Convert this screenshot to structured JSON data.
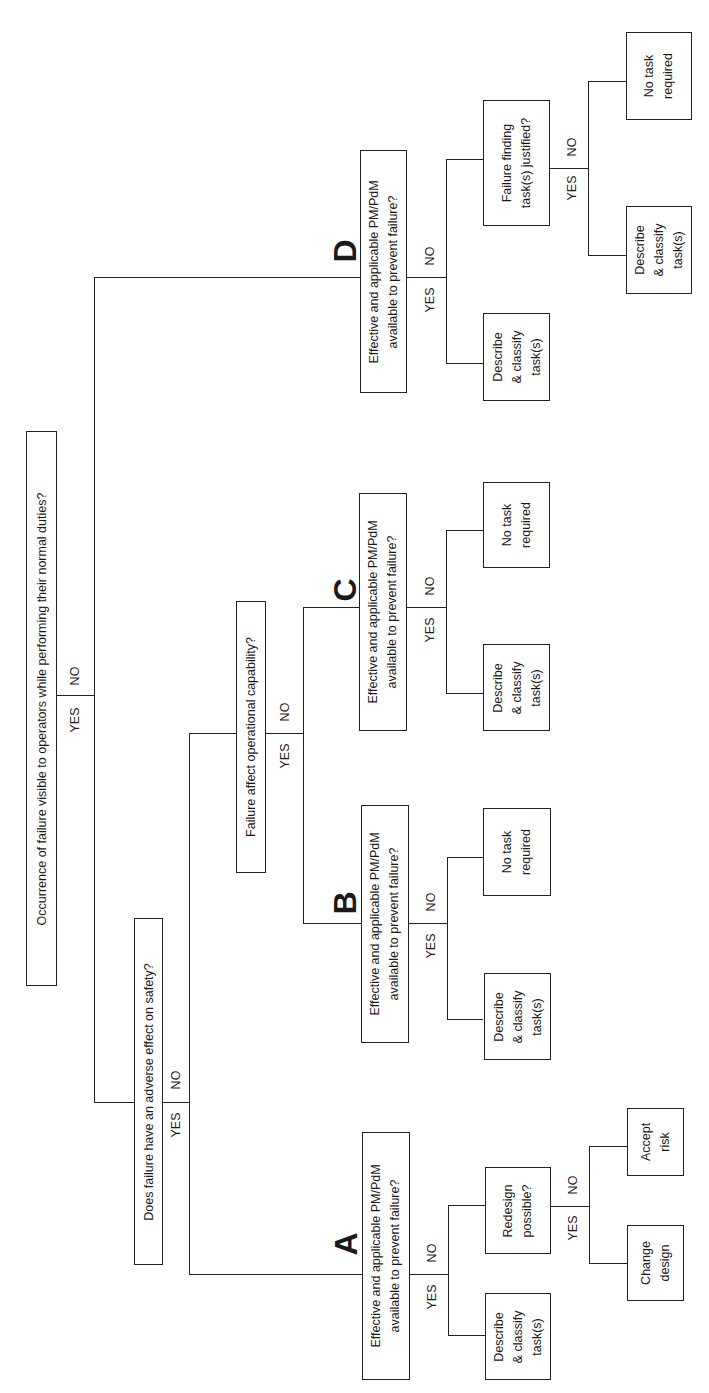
{
  "diagram": {
    "type": "decision-tree",
    "orientation": "rotated-90-ccw",
    "root": {
      "question": "Occurrence of failure visible to operators while performing their normal duties?",
      "yes_label": "YES",
      "no_label": "NO"
    },
    "safety": {
      "question": "Does failure have an adverse effect on safety?",
      "yes_label": "YES",
      "no_label": "NO"
    },
    "operational": {
      "question": "Failure affect operational capability?",
      "yes_label": "YES",
      "no_label": "NO"
    },
    "branch_a": {
      "letter": "A",
      "question_line1": "Effective and applicable PM/PdM",
      "question_line2": "available to prevent failure?",
      "yes_label": "YES",
      "no_label": "NO",
      "yes_outcome": [
        "Describe",
        "& classify",
        "task(s)"
      ],
      "redesign": {
        "question_line1": "Redesign",
        "question_line2": "possible?",
        "yes_label": "YES",
        "no_label": "NO",
        "yes_outcome": [
          "Change",
          "design"
        ],
        "no_outcome": [
          "Accept",
          "risk"
        ]
      }
    },
    "branch_b": {
      "letter": "B",
      "question_line1": "Effective and applicable PM/PdM",
      "question_line2": "available to prevent failure?",
      "yes_label": "YES",
      "no_label": "NO",
      "yes_outcome": [
        "Describe",
        "& classify",
        "task(s)"
      ],
      "no_outcome": [
        "No task",
        "required"
      ]
    },
    "branch_c": {
      "letter": "C",
      "question_line1": "Effective and applicable PM/PdM",
      "question_line2": "available to prevent failure?",
      "yes_label": "YES",
      "no_label": "NO",
      "yes_outcome": [
        "Describe",
        "& classify",
        "task(s)"
      ],
      "no_outcome": [
        "No task",
        "required"
      ]
    },
    "branch_d": {
      "letter": "D",
      "question_line1": "Effective and applicable PM/PdM",
      "question_line2": "available to prevent failure?",
      "yes_label": "YES",
      "no_label": "NO",
      "yes_outcome": [
        "Describe",
        "& classify",
        "task(s)"
      ],
      "failure_finding": {
        "question_line1": "Failure finding",
        "question_line2": "task(s) justified?",
        "yes_label": "YES",
        "no_label": "NO",
        "yes_outcome": [
          "Describe",
          "& classify",
          "task(s)"
        ],
        "no_outcome": [
          "No task",
          "required"
        ]
      }
    }
  }
}
